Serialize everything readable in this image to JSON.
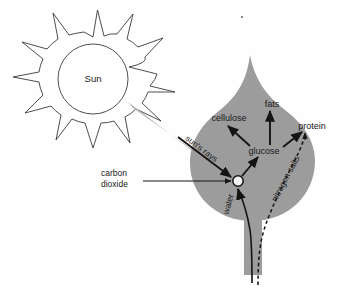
{
  "diagram": {
    "title_text": "Sun",
    "labels": {
      "sun": "Sun",
      "suns_rays": "sun's rays",
      "carbon_dioxide_line1": "carbon",
      "carbon_dioxide_line2": "dioxide",
      "cellulose": "cellulose",
      "fats": "fats",
      "protein": "protein",
      "glucose": "glucose",
      "water": "water",
      "nitrogen_salts": "nitrogen salts"
    },
    "colors": {
      "leaf_fill": "#9c9c9c",
      "ray_beam": "#b3b3b3",
      "ink": "#141414",
      "outline": "#3a3a3a",
      "background": "#fefefe",
      "hub_fill": "#f2f2f2"
    },
    "nodes": [
      {
        "id": "sun",
        "label": "Sun",
        "x": 93,
        "y": 79
      },
      {
        "id": "hub",
        "label": "",
        "x": 238,
        "y": 181
      },
      {
        "id": "glucose",
        "label": "glucose",
        "x": 264,
        "y": 151
      },
      {
        "id": "cellulose",
        "label": "cellulose",
        "x": 229,
        "y": 119
      },
      {
        "id": "fats",
        "label": "fats",
        "x": 272,
        "y": 105
      },
      {
        "id": "protein",
        "label": "protein",
        "x": 312,
        "y": 127
      }
    ],
    "flows": [
      {
        "from": "sun",
        "to": "hub",
        "label": "sun's rays",
        "style": "beam"
      },
      {
        "from": "carbon dioxide",
        "to": "hub",
        "label": "carbon dioxide",
        "style": "solid"
      },
      {
        "from": "root",
        "to": "hub",
        "label": "water",
        "style": "solid"
      },
      {
        "from": "hub",
        "to": "glucose",
        "label": "",
        "style": "solid"
      },
      {
        "from": "glucose",
        "to": "cellulose",
        "label": "",
        "style": "solid"
      },
      {
        "from": "glucose",
        "to": "fats",
        "label": "",
        "style": "solid"
      },
      {
        "from": "glucose",
        "to": "protein",
        "label": "",
        "style": "solid"
      },
      {
        "from": "root",
        "to": "protein",
        "label": "nitrogen salts",
        "style": "dashed"
      }
    ],
    "sun_ray_count": 11
  }
}
